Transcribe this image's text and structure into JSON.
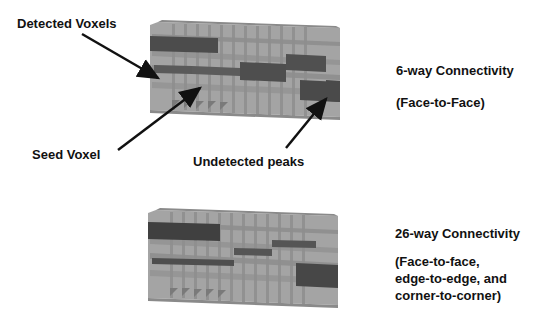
{
  "labels": {
    "detected_voxels": "Detected Voxels",
    "seed_voxel": "Seed Voxel",
    "undetected_peaks": "Undetected peaks"
  },
  "panels": [
    {
      "title": "6-way Connectivity",
      "description_lines": [
        "(Face-to-Face)"
      ]
    },
    {
      "title": "26-way Connectivity",
      "description_lines": [
        "(Face-to-face,",
        "edge-to-edge, and",
        "corner-to-corner)"
      ]
    }
  ],
  "colors": {
    "block_light": "#a8a8a8",
    "block_mid": "#8c8c8c",
    "voxel_dark": "#4a4a4a",
    "arrow": "#111111"
  }
}
